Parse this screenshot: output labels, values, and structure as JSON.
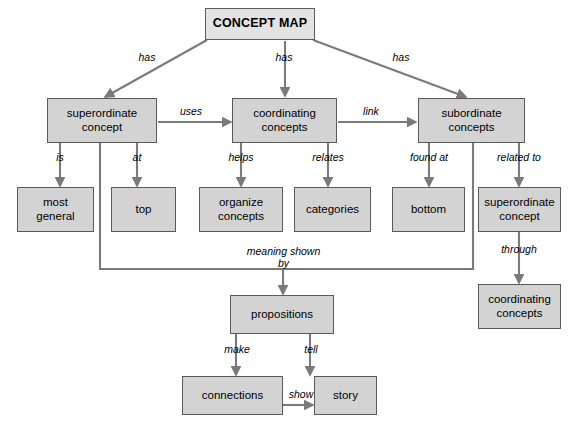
{
  "diagram": {
    "title": "CONCEPT MAP",
    "type": "concept-map",
    "nodes": {
      "root": "CONCEPT MAP",
      "superordinate_concept": "superordinate\nconcept",
      "coordinating_concepts": "coordinating\nconcepts",
      "subordinate_concepts": "subordinate\nconcepts",
      "most_general": "most\ngeneral",
      "top": "top",
      "organize_concepts": "organize\nconcepts",
      "categories": "categories",
      "bottom": "bottom",
      "superordinate_concept_2": "superordinate\nconcept",
      "coordinating_concepts_2": "coordinating\nconcepts",
      "propositions": "propositions",
      "connections": "connections",
      "story": "story"
    },
    "edge_labels": {
      "has_left": "has",
      "has_center": "has",
      "has_right": "has",
      "uses": "uses",
      "link": "link",
      "is": "is",
      "at": "at",
      "helps": "helps",
      "relates": "relates",
      "found_at": "found at",
      "related_to": "related to",
      "through": "through",
      "meaning_shown_by": "meaning shown\nby",
      "make": "make",
      "tell": "tell",
      "show": "show"
    },
    "colors": {
      "node_fill": "#d3d3d3",
      "root_fill": "#e3e3e3",
      "node_border": "#5a5a5a",
      "connector": "#7a7a7a",
      "background": "#ffffff",
      "text": "#000000"
    }
  }
}
